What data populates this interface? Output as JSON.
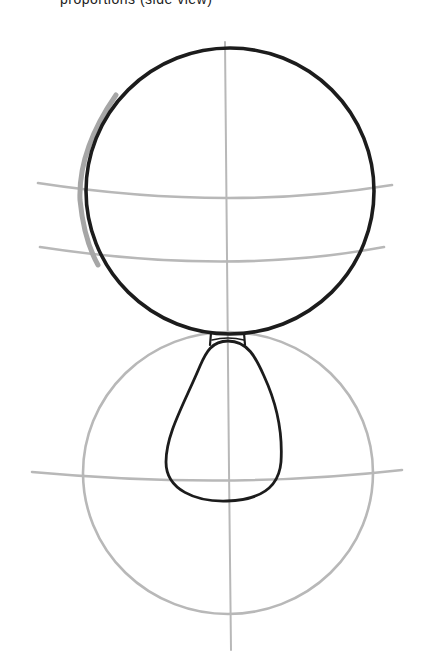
{
  "caption": {
    "text": "proportions (side view)",
    "visible": "cropped at top edge — only descenders shown"
  },
  "drawing": {
    "subject": "character construction sketch: head circle over body circle",
    "colors": {
      "ink": "#1a1a1a",
      "guide": "#b5b5b5",
      "paper": "#ffffff"
    },
    "head_circle": {
      "cx": 228,
      "cy": 191,
      "r": 145
    },
    "body_circle": {
      "cx": 228,
      "cy": 473,
      "r": 143
    },
    "vertical_guide": {
      "x1": 225,
      "y1": 42,
      "x2": 231,
      "y2": 650
    },
    "head_guides": [
      {
        "y_left": 183,
        "y_mid": 198,
        "y_right": 185
      },
      {
        "y_left": 247,
        "y_mid": 263,
        "y_right": 247
      }
    ],
    "body_guide": {
      "y_left": 472,
      "y_mid": 482,
      "y_right": 472
    },
    "neck": {
      "x_left": 212,
      "x_right": 244,
      "y_top": 333,
      "y_bottom": 344
    },
    "torso_teardrop": {
      "top_y": 342,
      "bottom_y": 501,
      "left_x": 165,
      "right_x": 282
    }
  }
}
